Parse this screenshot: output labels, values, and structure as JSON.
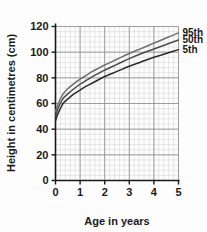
{
  "chart_data": {
    "type": "line",
    "title": "",
    "xlabel": "Age in years",
    "ylabel": "Height in centimetres (cm)",
    "xlim": [
      0,
      5
    ],
    "ylim": [
      0,
      120
    ],
    "x_ticks": [
      0,
      1,
      2,
      3,
      4,
      5
    ],
    "x_tick_labels": [
      "0",
      "1",
      "2",
      "3",
      "4",
      "5"
    ],
    "y_ticks": [
      0,
      20,
      40,
      60,
      80,
      100,
      120
    ],
    "y_tick_labels": [
      "0",
      "20",
      "40",
      "60",
      "80",
      "100",
      "120"
    ],
    "grid": true,
    "grid_major_x": 1,
    "grid_major_y": 20,
    "grid_minor_x": 0.2,
    "grid_minor_y": 4,
    "legend_position": "right-of-curve-ends",
    "x": [
      0,
      0.08,
      0.17,
      0.25,
      0.33,
      0.5,
      0.75,
      1,
      1.25,
      1.5,
      1.75,
      2,
      2.5,
      3,
      3.5,
      4,
      4.5,
      5
    ],
    "series": [
      {
        "name": "95th",
        "label": "95th",
        "color": "#6e6e6e",
        "values": [
          53.5,
          58.5,
          62.5,
          65.5,
          68.0,
          71.5,
          75.5,
          79.0,
          82.0,
          85.0,
          87.5,
          90.0,
          94.5,
          99.0,
          103.0,
          107.0,
          111.0,
          115.0
        ]
      },
      {
        "name": "50th",
        "label": "50th",
        "color": "#4a4a4a",
        "values": [
          50.0,
          55.0,
          59.0,
          62.0,
          64.5,
          67.5,
          71.5,
          75.0,
          78.0,
          81.0,
          83.5,
          86.0,
          90.5,
          95.0,
          99.0,
          102.5,
          106.0,
          109.5
        ]
      },
      {
        "name": "5th",
        "label": "5th",
        "color": "#2a2a2a",
        "values": [
          46.5,
          51.0,
          55.0,
          58.0,
          60.5,
          63.5,
          67.5,
          70.5,
          73.5,
          76.0,
          78.5,
          81.0,
          85.0,
          89.0,
          92.5,
          96.0,
          99.0,
          102.0
        ]
      }
    ]
  },
  "colors": {
    "background": "#fdfdfd",
    "axis": "#1a1a1a",
    "grid_major": "#8a8a8a",
    "grid_minor": "#d8d8d8",
    "text": "#1a1a1a"
  }
}
